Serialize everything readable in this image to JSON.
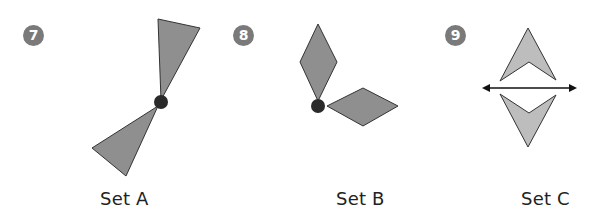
{
  "colors": {
    "badge": "#7a7a7a",
    "shape_fill_dark": "#8f8f8f",
    "shape_fill_light": "#bdbdbd",
    "stroke": "#333333",
    "dot": "#2a2a2a",
    "text": "#222222"
  },
  "problems": [
    {
      "number": "7",
      "label": "Set A",
      "description": "Two triangles meeting at a point marked with a dot"
    },
    {
      "number": "8",
      "label": "Set B",
      "description": "Two rhombuses meeting at a point marked with a dot"
    },
    {
      "number": "9",
      "label": "Set C",
      "description": "Two arrowhead shapes reflected across a double-headed line"
    }
  ]
}
